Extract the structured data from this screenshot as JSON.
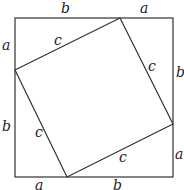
{
  "diagram": {
    "type": "pythagorean-proof",
    "outer_square": {
      "x1": 15,
      "y1": 18,
      "x2": 173,
      "y2": 177
    },
    "inner_square": [
      [
        120,
        18
      ],
      [
        173,
        124
      ],
      [
        67,
        177
      ],
      [
        15,
        70
      ]
    ],
    "stroke_color": "#333333",
    "labels": {
      "top_b": "b",
      "top_a": "a",
      "left_a": "a",
      "left_b": "b",
      "right_b": "b",
      "right_a": "a",
      "bottom_a": "a",
      "bottom_b": "b",
      "inner_top_c": "c",
      "inner_right_c": "c",
      "inner_left_c": "c",
      "inner_bottom_c": "c"
    }
  }
}
